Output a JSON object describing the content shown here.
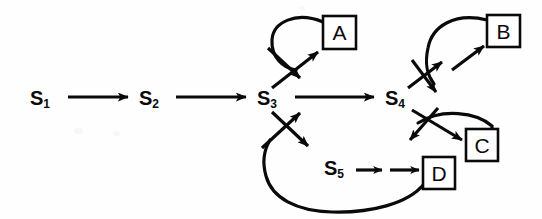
{
  "figure": {
    "kind": "state-transition-diagram",
    "ink_color": "#0a0a0a",
    "background_color": "#fefefe",
    "width": 542,
    "height": 219
  },
  "states": [
    {
      "id": "s1",
      "base": "S",
      "subscript": "1",
      "x": 30,
      "y": 88
    },
    {
      "id": "s2",
      "base": "S",
      "subscript": "2",
      "x": 139,
      "y": 88
    },
    {
      "id": "s3",
      "base": "S",
      "subscript": "3",
      "x": 257,
      "y": 88
    },
    {
      "id": "s4",
      "base": "S",
      "subscript": "4",
      "x": 385,
      "y": 88
    },
    {
      "id": "s5",
      "base": "S",
      "subscript": "5",
      "x": 324,
      "y": 158
    }
  ],
  "output_boxes": [
    {
      "id": "a",
      "label": "A",
      "x": 323,
      "y": 16,
      "w": 33,
      "h": 33
    },
    {
      "id": "b",
      "label": "B",
      "x": 487,
      "y": 15,
      "w": 33,
      "h": 32
    },
    {
      "id": "c",
      "label": "C",
      "x": 466,
      "y": 129,
      "w": 32,
      "h": 32
    },
    {
      "id": "d",
      "label": "D",
      "x": 423,
      "y": 157,
      "w": 32,
      "h": 32
    }
  ],
  "transitions": [
    {
      "id": "s1-s2",
      "from": "s1",
      "to": "s2",
      "style": "straight"
    },
    {
      "id": "s2-s3",
      "from": "s2",
      "to": "s3",
      "style": "straight"
    },
    {
      "id": "s3-s4",
      "from": "s3",
      "to": "s4",
      "style": "straight"
    },
    {
      "id": "s3-a",
      "from": "s3",
      "to": "a",
      "style": "curved-loop"
    },
    {
      "id": "s4-b",
      "from": "s4",
      "to": "b",
      "style": "curved-loop"
    },
    {
      "id": "s4-c",
      "from": "s4",
      "to": "c",
      "style": "curved-arc"
    },
    {
      "id": "s5-d",
      "from": "s5",
      "to": "d",
      "style": "double-short-arrow"
    },
    {
      "id": "s3-s5",
      "from": "s3",
      "to": "s5",
      "style": "diagonal"
    },
    {
      "id": "d-s3",
      "from": "d",
      "to": "s3",
      "style": "long-feedback-arc"
    }
  ]
}
